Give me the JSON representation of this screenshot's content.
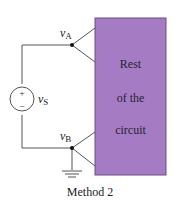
{
  "diagram": {
    "caption": "Method 2",
    "box": {
      "lines": [
        "Rest",
        "of the",
        "circuit"
      ],
      "fill": "#a57cc4",
      "stroke": "#6b4f80"
    },
    "source": {
      "plus": "+",
      "minus": "–",
      "label_main": "v",
      "label_sub": "S"
    },
    "node_a": {
      "label_main": "v",
      "label_sub": "A"
    },
    "node_b": {
      "label_main": "v",
      "label_sub": "B"
    },
    "wire_color": "#555555"
  }
}
